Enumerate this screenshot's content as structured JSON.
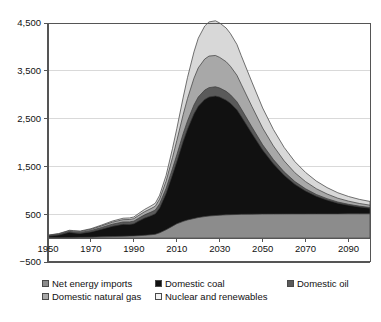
{
  "chart_data": {
    "type": "area",
    "stacked": true,
    "title": "",
    "subtitle": "",
    "xlabel": "",
    "ylabel": "",
    "xlim": [
      1950,
      2100
    ],
    "ylim": [
      -500,
      4500
    ],
    "ytick_values": [
      -500,
      500,
      1500,
      2500,
      3500,
      4500
    ],
    "ytick_labels": [
      "−500",
      "500",
      "1,500",
      "2,500",
      "3,500",
      "4,500"
    ],
    "xtick_values": [
      1950,
      1970,
      1990,
      2010,
      2030,
      2050,
      2070,
      2090
    ],
    "xtick_labels": [
      "1950",
      "1970",
      "1990",
      "2010",
      "2030",
      "2050",
      "2070",
      "2090"
    ],
    "grid": "horizontal",
    "legend_position": "bottom",
    "x": [
      1950,
      1955,
      1960,
      1962,
      1965,
      1970,
      1975,
      1980,
      1985,
      1988,
      1990,
      1992,
      1995,
      1998,
      2000,
      2002,
      2005,
      2008,
      2010,
      2013,
      2015,
      2018,
      2020,
      2023,
      2025,
      2028,
      2030,
      2033,
      2035,
      2038,
      2040,
      2045,
      2050,
      2055,
      2060,
      2065,
      2070,
      2075,
      2080,
      2085,
      2090,
      2095,
      2100
    ],
    "series": [
      {
        "name": "Net energy imports",
        "color": "#8c8c8c",
        "values": [
          5,
          8,
          12,
          14,
          16,
          20,
          26,
          32,
          38,
          42,
          45,
          50,
          58,
          70,
          80,
          110,
          175,
          250,
          300,
          350,
          380,
          410,
          430,
          450,
          462,
          472,
          480,
          486,
          490,
          494,
          497,
          500,
          502,
          503,
          504,
          505,
          505,
          506,
          506,
          506,
          507,
          507,
          507
        ]
      },
      {
        "name": "Domestic coal",
        "color": "#111111",
        "values": [
          35,
          55,
          110,
          95,
          80,
          110,
          160,
          215,
          250,
          245,
          255,
          300,
          360,
          400,
          430,
          520,
          760,
          1080,
          1300,
          1680,
          1900,
          2190,
          2330,
          2450,
          2490,
          2500,
          2470,
          2400,
          2330,
          2190,
          2050,
          1690,
          1340,
          1050,
          810,
          620,
          480,
          370,
          290,
          225,
          180,
          145,
          120
        ]
      },
      {
        "name": "Domestic oil",
        "color": "#5a5a5a",
        "values": [
          10,
          14,
          18,
          20,
          22,
          28,
          36,
          44,
          50,
          52,
          55,
          60,
          68,
          74,
          78,
          88,
          105,
          125,
          140,
          160,
          172,
          186,
          192,
          196,
          196,
          194,
          190,
          184,
          178,
          168,
          158,
          134,
          110,
          90,
          72,
          58,
          46,
          37,
          29,
          24,
          20,
          17,
          14
        ]
      },
      {
        "name": "Domestic natural gas",
        "color": "#a8a8a8",
        "values": [
          8,
          12,
          16,
          18,
          20,
          26,
          34,
          42,
          48,
          50,
          52,
          58,
          66,
          74,
          80,
          100,
          150,
          230,
          300,
          400,
          470,
          560,
          610,
          650,
          660,
          655,
          640,
          620,
          595,
          555,
          515,
          430,
          350,
          285,
          230,
          185,
          150,
          120,
          98,
          80,
          66,
          56,
          48
        ]
      },
      {
        "name": "Nuclear and renewables",
        "color": "#d8d8d8",
        "values": [
          4,
          6,
          8,
          9,
          10,
          13,
          18,
          24,
          30,
          33,
          35,
          40,
          48,
          56,
          62,
          80,
          120,
          190,
          250,
          360,
          440,
          550,
          620,
          690,
          715,
          725,
          720,
          705,
          685,
          645,
          600,
          510,
          420,
          345,
          282,
          232,
          192,
          160,
          134,
          114,
          98,
          86,
          78
        ]
      }
    ]
  },
  "legend": {
    "rows": [
      [
        {
          "label": "Net energy imports",
          "color": "#8c8c8c"
        },
        {
          "label": "Domestic coal",
          "color": "#111111"
        },
        {
          "label": "Domestic oil",
          "color": "#5a5a5a"
        }
      ],
      [
        {
          "label": "Domestic natural gas",
          "color": "#a8a8a8"
        },
        {
          "label": "Nuclear and renewables",
          "color": "#f2f2f2"
        }
      ]
    ],
    "column_x": [
      0,
      113,
      245
    ]
  },
  "style": {
    "axis_color": "#555555",
    "grid_color": "#d9d9d9",
    "band_outline": "#3a3a3a",
    "background": "#ffffff"
  }
}
